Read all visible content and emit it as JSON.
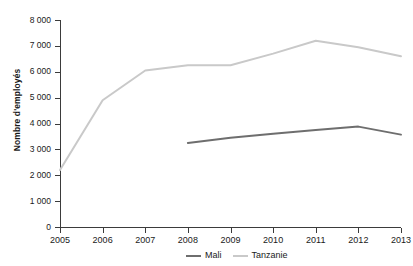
{
  "chart_data": {
    "type": "line",
    "title": "",
    "xlabel": "",
    "ylabel": "Nombre d'employés",
    "categories": [
      "2005",
      "2006",
      "2007",
      "2008",
      "2009",
      "2010",
      "2011",
      "2012",
      "2013"
    ],
    "x": [
      2005,
      2006,
      2007,
      2008,
      2009,
      2010,
      2011,
      2012,
      2013
    ],
    "xlim": [
      2005,
      2013
    ],
    "ylim": [
      0,
      8000
    ],
    "ytick_values": [
      0,
      1000,
      2000,
      3000,
      4000,
      5000,
      6000,
      7000,
      8000
    ],
    "ytick_labels": [
      "0",
      "1 000",
      "2 000",
      "3 000",
      "4 000",
      "5 000",
      "6 000",
      "7 000",
      "8 000"
    ],
    "grid": false,
    "legend_position": "bottom-right",
    "series": [
      {
        "name": "Mali",
        "color": "#6e6e6e",
        "x": [
          2008,
          2009,
          2010,
          2011,
          2012,
          2013
        ],
        "values": [
          3250,
          3450,
          3600,
          3750,
          3880,
          3570
        ]
      },
      {
        "name": "Tanzanie",
        "color": "#c9c9c9",
        "x": [
          2005,
          2006,
          2007,
          2008,
          2009,
          2010,
          2011,
          2012,
          2013
        ],
        "values": [
          2200,
          4900,
          6050,
          6250,
          6250,
          6700,
          7200,
          6950,
          6600
        ]
      }
    ]
  },
  "axes": {
    "y_title": "Nombre d'employés"
  },
  "legend": {
    "items": [
      {
        "label": "Mali",
        "color": "#6e6e6e"
      },
      {
        "label": "Tanzanie",
        "color": "#c9c9c9"
      }
    ]
  }
}
